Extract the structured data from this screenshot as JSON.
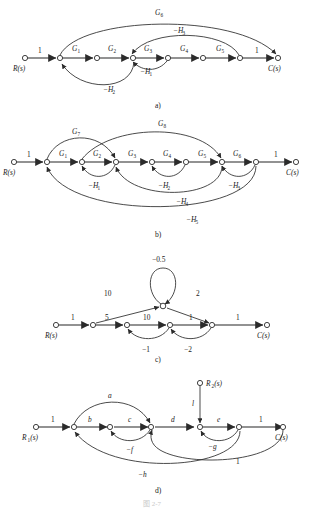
{
  "figure": {
    "caption_bottom": "图 2-7"
  },
  "panels": [
    {
      "id": "a",
      "caption": "a)",
      "input_label": "R(s)",
      "output_label": "C(s)",
      "chain_gains": [
        "1",
        "G₁",
        "G₂",
        "G₃",
        "G₄",
        "G₅",
        "1"
      ],
      "feedback_labels": [
        "G₆",
        "−H₃",
        "−H₁",
        "−H₂"
      ],
      "edges_text": {
        "forward_in": "1",
        "g1": "G1",
        "g2": "G2",
        "g3": "G3",
        "g4": "G4",
        "g5": "G5",
        "forward_out": "1",
        "g6": "G6",
        "h1": "-H1",
        "h2": "-H2",
        "h3": "-H3"
      }
    },
    {
      "id": "b",
      "caption": "b)",
      "input_label": "R(s)",
      "output_label": "C(s)",
      "chain_gains": [
        "1",
        "G₁",
        "G₂",
        "G₃",
        "G₄",
        "G₅",
        "G₆",
        "1"
      ],
      "feedforward_labels": [
        "G₇",
        "G₈"
      ],
      "feedback_labels": [
        "−H₁",
        "−H₂",
        "−H₃",
        "−H₄",
        "−H₅"
      ]
    },
    {
      "id": "c",
      "caption": "c)",
      "input_label": "R(s)",
      "output_label": "C(s)",
      "self_loop_gain": "−0.5",
      "branch_up_gain": "10",
      "branch_down_gain": "2",
      "chain_gains": [
        "1",
        "5",
        "10",
        "1",
        "1"
      ],
      "feedback_labels": [
        "−1",
        "−2"
      ]
    },
    {
      "id": "d",
      "caption": "d)",
      "input_label": "R₁(s)",
      "input2_label": "R₂(s)",
      "output_label": "C(s)",
      "chain_gains": [
        "1",
        "b",
        "c",
        "d",
        "e",
        "1"
      ],
      "input2_gain": "l",
      "feedforward_labels": [
        "a"
      ],
      "feedback_labels": [
        "−f",
        "−g",
        "−h",
        "1"
      ]
    }
  ],
  "labels": {
    "a": {
      "R": "R(s)",
      "C": "C(s)",
      "one_in": "1",
      "one_out": "1",
      "G1": "G",
      "G1s": "1",
      "G2": "G",
      "G2s": "2",
      "G3": "G",
      "G3s": "3",
      "G4": "G",
      "G4s": "4",
      "G5": "G",
      "G5s": "5",
      "G6": "G",
      "G6s": "6",
      "H1": "−H",
      "H1s": "1",
      "H2": "−H",
      "H2s": "2",
      "H3": "−H",
      "H3s": "3",
      "caption": "a)"
    },
    "b": {
      "R": "R(s)",
      "C": "C(s)",
      "one_in": "1",
      "one_out": "1",
      "G1": "G",
      "G1s": "1",
      "G2": "G",
      "G2s": "2",
      "G3": "G",
      "G3s": "3",
      "G4": "G",
      "G4s": "4",
      "G5": "G",
      "G5s": "5",
      "G6": "G",
      "G6s": "6",
      "G7": "G",
      "G7s": "7",
      "G8": "G",
      "G8s": "8",
      "H1": "−H",
      "H1s": "1",
      "H2": "−H",
      "H2s": "2",
      "H3": "−H",
      "H3s": "3",
      "H4": "−H",
      "H4s": "4",
      "H5": "−H",
      "H5s": "5",
      "caption": "b)"
    },
    "c": {
      "R": "R(s)",
      "C": "C(s)",
      "loop": "−0.5",
      "up": "10",
      "down": "2",
      "one_in": "1",
      "five": "5",
      "ten": "10",
      "one_mid": "1",
      "one_out": "1",
      "neg1": "−1",
      "neg2": "−2",
      "caption": "c)"
    },
    "d": {
      "R1": "R",
      "R1s": "1",
      "R1t": "(s)",
      "R2": "R",
      "R2s": "2",
      "R2t": "(s)",
      "C": "C(s)",
      "one_in": "1",
      "one_out": "1",
      "one_fb": "1",
      "a": "a",
      "b": "b",
      "c": "c",
      "d": "d",
      "e": "e",
      "l": "l",
      "f": "−f",
      "g": "−g",
      "h": "−h",
      "caption": "d)"
    }
  }
}
